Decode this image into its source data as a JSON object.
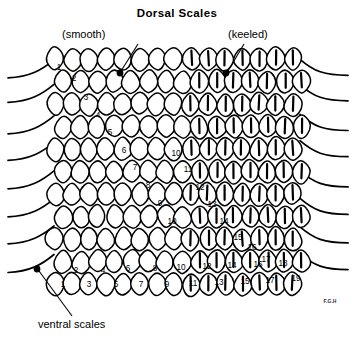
{
  "figure": {
    "title": "Dorsal Scales",
    "background_color": "#ffffff",
    "ink_color": "#000000",
    "signature": "F.G.H"
  },
  "callouts": [
    {
      "name": "smooth",
      "text": "(smooth)",
      "text_x": 62,
      "text_y": 38,
      "leader": "M 138 44 L 121 71",
      "dot_x": 120,
      "dot_y": 73
    },
    {
      "name": "keeled",
      "text": "(keeled)",
      "text_x": 228,
      "text_y": 38,
      "leader": "M 244 44 L 228 71",
      "dot_x": 226,
      "dot_y": 73
    },
    {
      "name": "ventral-scales",
      "text": "ventral scales",
      "text_x": 38,
      "text_y": 328,
      "leader": "M 72 316 L 39 271",
      "dot_x": 37,
      "dot_y": 269
    }
  ],
  "scale_rows": {
    "count": 11,
    "top_y": 58,
    "row_spacing": 22.5,
    "left_x": 55,
    "col_spacing": 17.0,
    "cols": 15,
    "keel_start_col": 8,
    "note_smooth_side": "left",
    "note_keeled_side": "right"
  },
  "numbering": {
    "diagonal_down_right": {
      "description": "row count descending from dorsal midline toward the ventral scales on the left side",
      "values": [
        1,
        2,
        3,
        4,
        5,
        6,
        7,
        8,
        9,
        10
      ],
      "points": [
        [
          59,
          70
        ],
        [
          74,
          81
        ],
        [
          86,
          100
        ],
        [
          98,
          118
        ],
        [
          110,
          135
        ],
        [
          124,
          153
        ],
        [
          135,
          170
        ],
        [
          148,
          188
        ],
        [
          160,
          206
        ],
        [
          172,
          224
        ]
      ]
    },
    "diagonal_down_left": {
      "description": "row count ascending toward the ventral scales on the right side",
      "values": [
        10,
        11,
        12,
        13,
        14,
        15,
        16,
        17
      ],
      "points": [
        [
          176,
          156
        ],
        [
          188,
          172
        ],
        [
          200,
          190
        ],
        [
          212,
          207
        ],
        [
          224,
          224
        ],
        [
          238,
          240
        ],
        [
          252,
          250
        ],
        [
          266,
          262
        ]
      ]
    },
    "bottom_row_upper": {
      "description": "alternating upper bottom-row scale numbers",
      "values": [
        2,
        4,
        6,
        8,
        10,
        12,
        14,
        16,
        18
      ],
      "points": [
        [
          76,
          273
        ],
        [
          103,
          273
        ],
        [
          128,
          271
        ],
        [
          155,
          271
        ],
        [
          181,
          270
        ],
        [
          207,
          269
        ],
        [
          232,
          268
        ],
        [
          258,
          267
        ],
        [
          283,
          266
        ]
      ]
    },
    "bottom_row_lower": {
      "description": "alternating lower bottom-row scale numbers",
      "values": [
        1,
        3,
        5,
        7,
        9,
        11,
        13,
        15,
        17,
        19
      ],
      "points": [
        [
          63,
          287
        ],
        [
          89,
          287
        ],
        [
          116,
          287
        ],
        [
          141,
          287
        ],
        [
          167,
          287
        ],
        [
          193,
          286
        ],
        [
          219,
          285
        ],
        [
          245,
          284
        ],
        [
          270,
          283
        ],
        [
          296,
          281
        ]
      ]
    }
  },
  "ventral_edges": {
    "left_lines": 8,
    "right_lines": 8,
    "description": "smooth curving lines representing ventral scale edges extending past the body outline"
  }
}
